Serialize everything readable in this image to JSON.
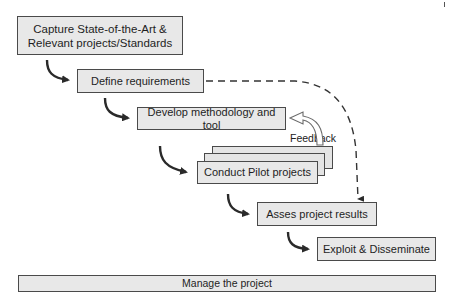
{
  "diagram": {
    "type": "process-flow",
    "steps": [
      {
        "id": "capture",
        "label": "Capture State-of-the-Art & Relevant projects/Standards",
        "line1": "Capture State-of-the-Art &",
        "line2": "Relevant projects/Standards"
      },
      {
        "id": "define",
        "label": "Define requirements"
      },
      {
        "id": "develop",
        "label": "Develop methodology and tool"
      },
      {
        "id": "conduct",
        "label": "Conduct Pilot projects"
      },
      {
        "id": "assess",
        "label": "Asses project results"
      },
      {
        "id": "exploit",
        "label": "Exploit & Disseminate"
      }
    ],
    "feedback_label": "Feedback",
    "manage": {
      "label": "Manage the project"
    },
    "connections": [
      {
        "from": "capture",
        "to": "define",
        "style": "solid-curved-arrow"
      },
      {
        "from": "define",
        "to": "develop",
        "style": "solid-curved-arrow"
      },
      {
        "from": "develop",
        "to": "conduct",
        "style": "solid-curved-arrow"
      },
      {
        "from": "conduct",
        "to": "assess",
        "style": "solid-curved-arrow"
      },
      {
        "from": "assess",
        "to": "exploit",
        "style": "solid-curved-arrow"
      },
      {
        "from": "define",
        "to": "assess",
        "style": "dashed-arrow"
      },
      {
        "from": "conduct",
        "to": "develop",
        "style": "hollow-feedback-arrow",
        "label": "Feedback"
      }
    ],
    "colors": {
      "box_fill": "#e8e8e8",
      "box_border": "#4a4a4a",
      "arrow": "#2a2a2a"
    }
  }
}
